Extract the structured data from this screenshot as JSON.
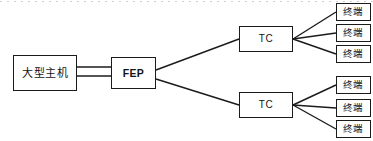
{
  "diagram": {
    "type": "hierarchical-network-topology",
    "background_color": "#ffffff",
    "line_color": "#1b1b1b",
    "text_color": "#141414",
    "nodes": {
      "host": {
        "label": "大型主机",
        "role": "mainframe"
      },
      "fep": {
        "label": "FEP",
        "role": "front-end-processor"
      },
      "tc_top": {
        "label": "TC",
        "role": "terminal-controller"
      },
      "tc_bottom": {
        "label": "TC",
        "role": "terminal-controller"
      },
      "terminals_top": [
        {
          "label": "终端"
        },
        {
          "label": "终端"
        },
        {
          "label": "终端"
        }
      ],
      "terminals_bottom": [
        {
          "label": "终端"
        },
        {
          "label": "终端"
        },
        {
          "label": "终端"
        }
      ]
    },
    "links": {
      "host_to_fep": "double-line",
      "fep_to_tc": "single-line",
      "tc_to_terminal": "single-line"
    }
  }
}
